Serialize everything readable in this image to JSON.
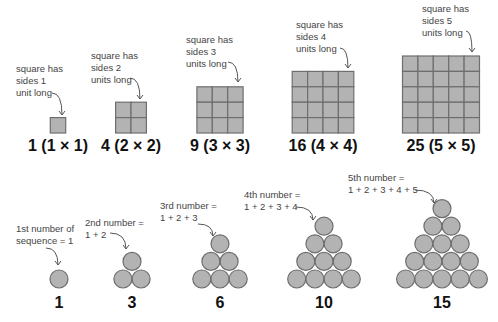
{
  "colors": {
    "fill": "#b3b3b3",
    "stroke": "#6e6e6e",
    "text": "#111111",
    "annotation": "#444444"
  },
  "squares": [
    {
      "n": 1,
      "label": "1 (1 × 1)",
      "annotation": "square has\nsides 1\nunit long"
    },
    {
      "n": 2,
      "label": "4 (2 × 2)",
      "annotation": "square has\nsides 2\nunits long"
    },
    {
      "n": 3,
      "label": "9 (3 × 3)",
      "annotation": "square has\nsides 3\nunits long"
    },
    {
      "n": 4,
      "label": "16 (4 × 4)",
      "annotation": "square has\nsides 4\nunits long"
    },
    {
      "n": 5,
      "label": "25 (5 × 5)",
      "annotation": "square has\nsides 5\nunits long"
    }
  ],
  "triangles": [
    {
      "n": 1,
      "label": "1",
      "annotation": "1st number of\nsequence = 1"
    },
    {
      "n": 2,
      "label": "3",
      "annotation": "2nd number =\n1 + 2"
    },
    {
      "n": 3,
      "label": "6",
      "annotation": "3rd number =\n1 + 2 + 3"
    },
    {
      "n": 4,
      "label": "10",
      "annotation": "4th number =\n1 + 2 + 3 + 4"
    },
    {
      "n": 5,
      "label": "15",
      "annotation": "5th number =\n1 + 2 + 3 + 4 + 5"
    }
  ]
}
